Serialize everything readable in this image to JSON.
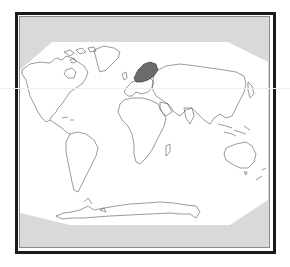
{
  "map": {
    "type": "world-outline-map",
    "projection": "robinson-like",
    "highlighted_region": "Scandinavia (Norway, Sweden, Finland)",
    "colors": {
      "outer_frame": "#1a1a1a",
      "inner_frame": "#8a8a8a",
      "off_map_fill": "#d9d9d9",
      "map_fill": "#ffffff",
      "coastline": "#555555",
      "highlight_fill": "#6b6b6b"
    },
    "regions": [
      {
        "name": "North America",
        "highlighted": false
      },
      {
        "name": "Greenland",
        "highlighted": false
      },
      {
        "name": "South America",
        "highlighted": false
      },
      {
        "name": "Europe",
        "highlighted": false
      },
      {
        "name": "Scandinavia",
        "highlighted": true
      },
      {
        "name": "Africa",
        "highlighted": false
      },
      {
        "name": "Madagascar",
        "highlighted": false
      },
      {
        "name": "Asia",
        "highlighted": false
      },
      {
        "name": "Japan",
        "highlighted": false
      },
      {
        "name": "Southeast Asia / Indonesia",
        "highlighted": false
      },
      {
        "name": "Australia",
        "highlighted": false
      },
      {
        "name": "New Zealand",
        "highlighted": false
      },
      {
        "name": "Antarctica",
        "highlighted": false
      }
    ]
  }
}
